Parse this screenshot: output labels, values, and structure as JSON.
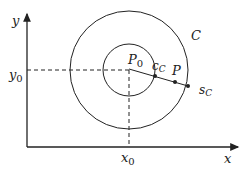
{
  "diagram": {
    "axis_x_label": "x",
    "axis_y_label": "y",
    "x0_label": "x",
    "x0_sub": "0",
    "y0_label": "y",
    "y0_sub": "0",
    "center_label": "P",
    "center_sub": "0",
    "outer_circle_label": "C",
    "inner_point_label": "c",
    "inner_point_sub": "C",
    "point_label": "P",
    "outer_point_label": "s",
    "outer_point_sub": "C"
  }
}
